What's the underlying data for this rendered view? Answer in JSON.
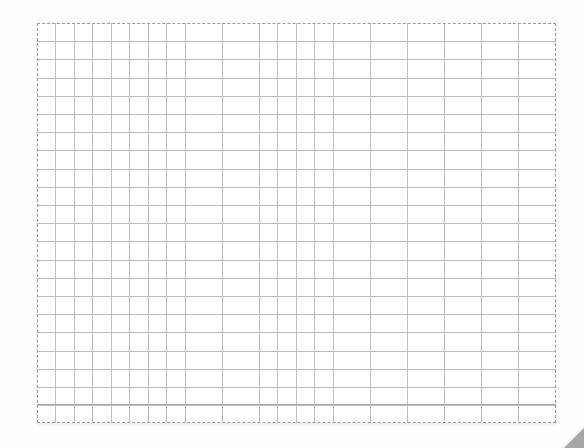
{
  "grid": {
    "columns": 28,
    "rows": 22,
    "cell_width_px": 18.5,
    "cell_height_px": 18.2,
    "line_color": "#bdbdbd",
    "border_color": "#9a9a9a",
    "background_color": "#ffffff"
  },
  "page_curl": {
    "color": "#a7a7a7"
  }
}
